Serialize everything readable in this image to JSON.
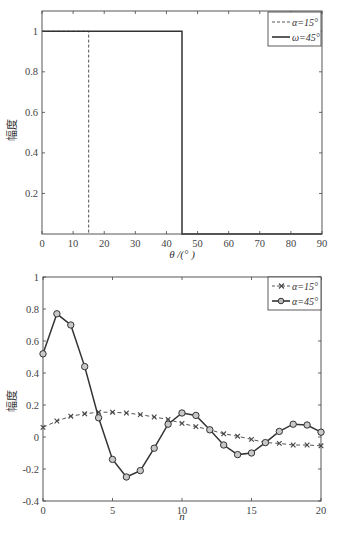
{
  "chart_data": [
    {
      "type": "line",
      "title": "",
      "xlabel": "θ /(° )",
      "ylabel": "幅度",
      "xlim": [
        0,
        90
      ],
      "ylim": [
        0,
        1.1
      ],
      "xticks": [
        0,
        10,
        20,
        30,
        40,
        50,
        60,
        70,
        80,
        90
      ],
      "yticks": [
        0.2,
        0.4,
        0.6,
        0.8,
        1
      ],
      "ytick_labels": [
        "0.2",
        "0.4",
        "0.6",
        "0.8",
        "1"
      ],
      "grid": false,
      "legend_position": "upper right",
      "series": [
        {
          "name": "α=15°",
          "style": "dashed",
          "color": "#555555",
          "x": [
            0,
            15,
            15
          ],
          "y": [
            1,
            1,
            0
          ]
        },
        {
          "name": "ω=45°",
          "style": "solid",
          "color": "#333333",
          "x": [
            0,
            45,
            45,
            90
          ],
          "y": [
            1,
            1,
            0,
            0
          ]
        }
      ]
    },
    {
      "type": "line",
      "title": "",
      "xlabel": "n",
      "ylabel": "幅度",
      "xlim": [
        0,
        20
      ],
      "ylim": [
        -0.4,
        1
      ],
      "xticks": [
        0,
        5,
        10,
        15,
        20
      ],
      "yticks": [
        -0.4,
        -0.2,
        0,
        0.2,
        0.4,
        0.6,
        0.8,
        1
      ],
      "ytick_labels": [
        "-0.4",
        "-0.2",
        "0",
        "0.2",
        "0.4",
        "0.6",
        "0.8",
        "1"
      ],
      "grid": false,
      "legend_position": "upper right",
      "x": [
        0,
        1,
        2,
        3,
        4,
        5,
        6,
        7,
        8,
        9,
        10,
        11,
        12,
        13,
        14,
        15,
        16,
        17,
        18,
        19,
        20
      ],
      "series": [
        {
          "name": "α=15°",
          "style": "dashed",
          "marker": "x",
          "color": "#555555",
          "values": [
            0.06,
            0.1,
            0.13,
            0.145,
            0.155,
            0.155,
            0.15,
            0.14,
            0.125,
            0.11,
            0.085,
            0.065,
            0.045,
            0.02,
            0.005,
            -0.015,
            -0.035,
            -0.04,
            -0.05,
            -0.05,
            -0.055
          ]
        },
        {
          "name": "α=45°",
          "style": "solid",
          "marker": "o",
          "color": "#333333",
          "values": [
            0.52,
            0.77,
            0.7,
            0.44,
            0.12,
            -0.14,
            -0.25,
            -0.21,
            -0.07,
            0.08,
            0.15,
            0.135,
            0.045,
            -0.05,
            -0.11,
            -0.1,
            -0.035,
            0.035,
            0.08,
            0.075,
            0.03
          ]
        }
      ]
    }
  ]
}
